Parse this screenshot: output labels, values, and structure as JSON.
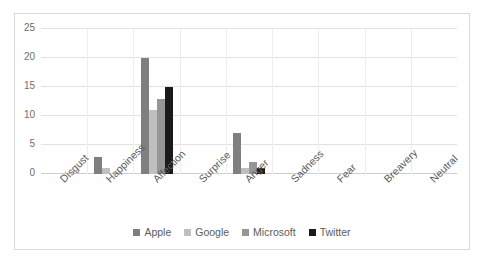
{
  "chart_data": {
    "type": "bar",
    "title": "",
    "subtitle": "",
    "xlabel": "",
    "ylabel": "",
    "ylim": [
      0,
      25
    ],
    "ytick_labels": [
      "0",
      "5",
      "10",
      "15",
      "20",
      "25"
    ],
    "ytick_values": [
      0,
      5,
      10,
      15,
      20,
      25
    ],
    "grid": true,
    "legend_position": "bottom",
    "categories": [
      "Disgust",
      "Happiness",
      "Affection",
      "Surprise",
      "Anger",
      "Sadness",
      "Fear",
      "Breavery",
      "Neutral"
    ],
    "series": [
      {
        "name": "Apple",
        "color": "#7f7f7f",
        "values": [
          0,
          3,
          20,
          0,
          7,
          0,
          0,
          0,
          0
        ]
      },
      {
        "name": "Google",
        "color": "#bfbfbf",
        "values": [
          0,
          1,
          11,
          0,
          1,
          0,
          0,
          0,
          0
        ]
      },
      {
        "name": "Microsoft",
        "color": "#969696",
        "values": [
          0,
          0,
          13,
          0,
          2,
          0,
          0,
          0,
          0
        ]
      },
      {
        "name": "Twitter",
        "color": "#1a1a1a",
        "values": [
          0,
          0,
          15,
          0,
          1,
          0,
          0,
          0,
          0
        ]
      }
    ]
  },
  "figure": {
    "border_color": "#d9d9d9",
    "background": "#ffffff",
    "gridline_color": "#e2e2e2",
    "axis_text_color": "#5c5c5c"
  }
}
